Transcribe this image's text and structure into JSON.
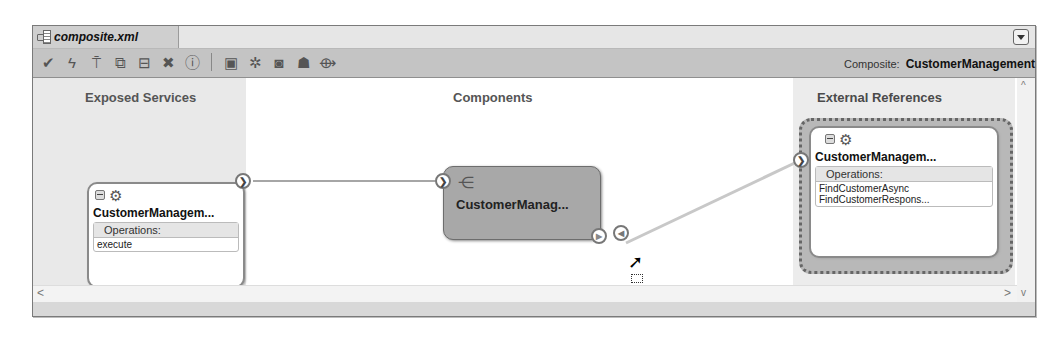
{
  "tab": {
    "label": "composite.xml",
    "icon": "composite-file-icon"
  },
  "toolbar": {
    "icons": [
      "validate-check-icon",
      "deploy-bolt-icon",
      "test-antenna-icon",
      "copy-icon",
      "layout-icon",
      "delete-x-icon",
      "info-icon",
      "separator",
      "database-icon",
      "services-icon",
      "record-icon",
      "component-palette-icon",
      "wiring-icon"
    ],
    "composite_label": "Composite:",
    "composite_name": "CustomerManagement"
  },
  "lanes": {
    "exposed": "Exposed Services",
    "components": "Components",
    "external": "External References"
  },
  "exposed_service": {
    "name": "CustomerManagem...",
    "operations_label": "Operations:",
    "operations": [
      "execute"
    ]
  },
  "component": {
    "name": "CustomerManag..."
  },
  "external_reference": {
    "name": "CustomerManagem...",
    "operations_label": "Operations:",
    "operations": [
      "FindCustomerAsync",
      "FindCustomerRespons..."
    ]
  },
  "scroll": {
    "up": "^",
    "down": "v",
    "left": "<",
    "right": ">"
  }
}
